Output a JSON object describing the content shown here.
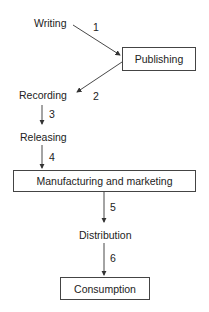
{
  "diagram": {
    "type": "flowchart",
    "nodes": [
      {
        "id": "writing",
        "label": "Writing",
        "boxed": false
      },
      {
        "id": "publishing",
        "label": "Publishing",
        "boxed": true
      },
      {
        "id": "recording",
        "label": "Recording",
        "boxed": false
      },
      {
        "id": "releasing",
        "label": "Releasing",
        "boxed": false
      },
      {
        "id": "manufacturing",
        "label": "Manufacturing and marketing",
        "boxed": true
      },
      {
        "id": "distribution",
        "label": "Distribution",
        "boxed": false
      },
      {
        "id": "consumption",
        "label": "Consumption",
        "boxed": true
      }
    ],
    "edges": [
      {
        "from": "writing",
        "to": "publishing",
        "label": "1"
      },
      {
        "from": "publishing",
        "to": "recording",
        "label": "2"
      },
      {
        "from": "recording",
        "to": "releasing",
        "label": "3"
      },
      {
        "from": "releasing",
        "to": "manufacturing",
        "label": "4"
      },
      {
        "from": "manufacturing",
        "to": "distribution",
        "label": "5"
      },
      {
        "from": "distribution",
        "to": "consumption",
        "label": "6"
      }
    ],
    "line_color": "#333333"
  }
}
